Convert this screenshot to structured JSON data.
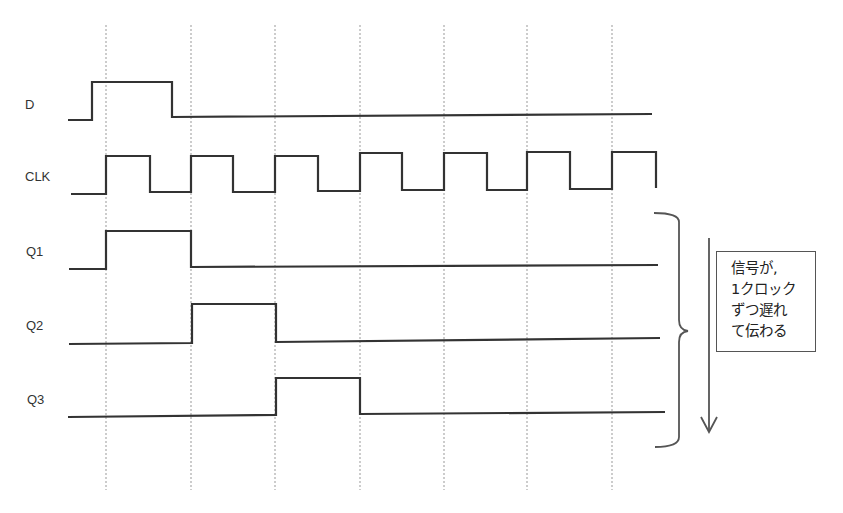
{
  "diagram": {
    "signals": [
      {
        "name": "D",
        "label": "D",
        "waveform": [
          0,
          1,
          0,
          0,
          0,
          0,
          0,
          0
        ]
      },
      {
        "name": "CLK",
        "label": "CLK",
        "waveform": "clock",
        "cycles": 7
      },
      {
        "name": "Q1",
        "label": "Q1",
        "waveform": [
          0,
          1,
          0,
          0,
          0,
          0,
          0,
          0
        ]
      },
      {
        "name": "Q2",
        "label": "Q2",
        "waveform": [
          0,
          0,
          1,
          0,
          0,
          0,
          0,
          0
        ]
      },
      {
        "name": "Q3",
        "label": "Q3",
        "waveform": [
          0,
          0,
          0,
          1,
          0,
          0,
          0,
          0
        ]
      }
    ],
    "annotation": {
      "lines": [
        "信号が,",
        "1クロック",
        "ずつ遅れ",
        "て伝わる"
      ],
      "arrow_direction": "down",
      "bracket_spans": [
        "Q1",
        "Q2",
        "Q3"
      ]
    },
    "colors": {
      "signal": "#333333",
      "gridline": "#999999",
      "box_border": "#555555"
    }
  }
}
